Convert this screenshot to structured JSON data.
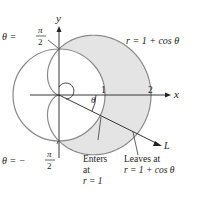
{
  "figure": {
    "colors": {
      "curve": "#8a8a8a",
      "shade": "#e4e4e4",
      "axis": "#222222",
      "text": "#222222"
    },
    "axes": {
      "x_label": "x",
      "y_label": "y",
      "tick_1": "1",
      "tick_2": "2"
    },
    "curve_label": "r = 1 + cos θ",
    "angle_label": "θ",
    "ray_label": "L",
    "top_label": {
      "lhs": "θ =",
      "num": "π",
      "den": "2"
    },
    "bottom_label": {
      "lhs": "θ = −",
      "num": "π",
      "den": "2"
    },
    "enters_label": [
      "Enters",
      "at",
      "r = 1"
    ],
    "leaves_label": [
      "Leaves at",
      "r = 1 + cos θ"
    ]
  }
}
